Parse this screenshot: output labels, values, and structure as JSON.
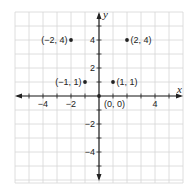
{
  "chart_data": {
    "type": "scatter",
    "title": "",
    "xlabel": "x",
    "ylabel": "y",
    "xlim": [
      -6,
      6
    ],
    "ylim": [
      -6,
      6
    ],
    "grid": true,
    "grid_step": 1,
    "x_ticks": [
      -4,
      -2,
      4
    ],
    "x_tick_labels": [
      "−4",
      "−2",
      "4"
    ],
    "y_ticks": [
      4,
      2,
      -2,
      -4
    ],
    "y_tick_labels": [
      "4",
      "2",
      "−2",
      "−4"
    ],
    "points": [
      {
        "x": -2,
        "y": 4,
        "label": "(−2, 4)",
        "label_side": "left"
      },
      {
        "x": 2,
        "y": 4,
        "label": "(2, 4)",
        "label_side": "right"
      },
      {
        "x": -1,
        "y": 1,
        "label": "(−1, 1)",
        "label_side": "left"
      },
      {
        "x": 1,
        "y": 1,
        "label": "(1, 1)",
        "label_side": "right"
      },
      {
        "x": 0,
        "y": 0,
        "label": "(0, 0)",
        "label_side": "below-right"
      }
    ],
    "colors": {
      "grid": "#d6d6d6",
      "axis": "#222222",
      "point": "#222222",
      "text": "#222222"
    }
  }
}
